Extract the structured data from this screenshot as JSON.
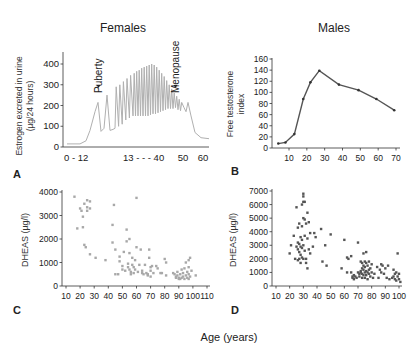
{
  "figure": {
    "xlabel": "Age (years)",
    "titles": {
      "females": "Females",
      "males": "Males"
    }
  },
  "chart_data": [
    {
      "panel": "A",
      "type": "line",
      "title": "Females",
      "ylabel": "Estrogen excreted in urine (µg/24 hours)",
      "ylabel_lines": [
        "Estrogen excreted in urine",
        "(µg/24 hours)"
      ],
      "xlabel": "",
      "x_tick_labels": [
        "0 - 12",
        "13 - - - 40",
        "50",
        "60"
      ],
      "y_ticks": [
        0,
        100,
        200,
        300,
        400
      ],
      "ylim": [
        0,
        450
      ],
      "color": "#b0b0b0",
      "annotations": [
        {
          "text": "Puberty",
          "y": 215
        },
        {
          "text": "Menopause",
          "y": 215
        }
      ],
      "description": "Low baseline (~15) during childhood 0-12, rises to ~215 at puberty, cyclic oscillations with peaks rising to ~400 and troughs ~150 during reproductive years 13-40, declining peaks to ~215 at menopause (~47), then falls to ~40 by 60."
    },
    {
      "panel": "B",
      "type": "line",
      "title": "Males",
      "ylabel": "Free testosterone index",
      "ylabel_lines": [
        "Free testosterone",
        "index"
      ],
      "x": [
        4,
        8,
        13,
        18,
        22,
        27,
        38,
        49,
        59,
        69
      ],
      "values": [
        8,
        10,
        25,
        88,
        118,
        139,
        114,
        104,
        88,
        68
      ],
      "x_ticks": [
        10,
        20,
        30,
        40,
        50,
        60,
        70
      ],
      "y_ticks": [
        0,
        20,
        40,
        60,
        80,
        100,
        120,
        140,
        160
      ],
      "xlim": [
        0,
        70
      ],
      "ylim": [
        0,
        160
      ],
      "color": "#555555"
    },
    {
      "panel": "C",
      "type": "scatter",
      "title": "",
      "ylabel": "DHEAS (µg/l)",
      "x_ticks": [
        10,
        20,
        30,
        40,
        50,
        60,
        70,
        80,
        90,
        100,
        110
      ],
      "y_ticks": [
        0,
        1000,
        2000,
        3000,
        4000
      ],
      "xlim": [
        10,
        110
      ],
      "ylim": [
        0,
        4000
      ],
      "color": "#a8a8a8",
      "points": [
        [
          16,
          3800
        ],
        [
          18,
          2450
        ],
        [
          20,
          3300
        ],
        [
          21,
          3200
        ],
        [
          22,
          2950
        ],
        [
          22,
          2500
        ],
        [
          23,
          3500
        ],
        [
          23,
          1750
        ],
        [
          24,
          1650
        ],
        [
          25,
          3650
        ],
        [
          25,
          3350
        ],
        [
          25,
          3200
        ],
        [
          27,
          3600
        ],
        [
          27,
          3300
        ],
        [
          27,
          1350
        ],
        [
          31,
          1200
        ],
        [
          38,
          1100
        ],
        [
          43,
          2600
        ],
        [
          43,
          1850
        ],
        [
          44,
          3450
        ],
        [
          45,
          1550
        ],
        [
          45,
          500
        ],
        [
          47,
          500
        ],
        [
          48,
          1250
        ],
        [
          48,
          1050
        ],
        [
          50,
          850
        ],
        [
          50,
          700
        ],
        [
          51,
          1450
        ],
        [
          52,
          650
        ],
        [
          53,
          2400
        ],
        [
          53,
          1900
        ],
        [
          54,
          950
        ],
        [
          54,
          800
        ],
        [
          55,
          2000
        ],
        [
          55,
          1400
        ],
        [
          55,
          700
        ],
        [
          56,
          600
        ],
        [
          56,
          500
        ],
        [
          57,
          1200
        ],
        [
          57,
          900
        ],
        [
          58,
          800
        ],
        [
          58,
          550
        ],
        [
          59,
          1100
        ],
        [
          59,
          700
        ],
        [
          60,
          3750
        ],
        [
          60,
          1650
        ],
        [
          61,
          600
        ],
        [
          62,
          900
        ],
        [
          63,
          1550
        ],
        [
          64,
          650
        ],
        [
          64,
          550
        ],
        [
          65,
          500
        ],
        [
          66,
          900
        ],
        [
          67,
          550
        ],
        [
          68,
          500
        ],
        [
          68,
          450
        ],
        [
          69,
          1550
        ],
        [
          69,
          1200
        ],
        [
          70,
          800
        ],
        [
          70,
          650
        ],
        [
          70,
          400
        ],
        [
          71,
          850
        ],
        [
          72,
          550
        ],
        [
          74,
          850
        ],
        [
          75,
          750
        ],
        [
          77,
          550
        ],
        [
          78,
          550
        ],
        [
          80,
          1150
        ],
        [
          81,
          1000
        ],
        [
          81,
          450
        ],
        [
          86,
          550
        ],
        [
          87,
          500
        ],
        [
          88,
          400
        ],
        [
          88,
          350
        ],
        [
          89,
          600
        ],
        [
          89,
          450
        ],
        [
          90,
          350
        ],
        [
          90,
          300
        ],
        [
          91,
          500
        ],
        [
          91,
          300
        ],
        [
          92,
          350
        ],
        [
          92,
          700
        ],
        [
          93,
          550
        ],
        [
          93,
          400
        ],
        [
          94,
          750
        ],
        [
          94,
          300
        ],
        [
          95,
          1000
        ],
        [
          95,
          450
        ],
        [
          96,
          600
        ],
        [
          96,
          350
        ],
        [
          97,
          1100
        ],
        [
          97,
          800
        ],
        [
          97,
          500
        ],
        [
          97,
          300
        ],
        [
          98,
          1200
        ],
        [
          98,
          400
        ],
        [
          99,
          650
        ],
        [
          102,
          450
        ]
      ]
    },
    {
      "panel": "D",
      "type": "scatter",
      "title": "",
      "ylabel": "DHEAS (µg/l)",
      "x_ticks": [
        10,
        20,
        30,
        40,
        50,
        60,
        70,
        80,
        90,
        100
      ],
      "y_ticks": [
        0,
        1000,
        2000,
        3000,
        4000,
        5000,
        6000,
        7000
      ],
      "xlim": [
        10,
        100
      ],
      "ylim": [
        0,
        7000
      ],
      "color": "#555555",
      "points": [
        [
          20,
          2400
        ],
        [
          21,
          3000
        ],
        [
          23,
          3700
        ],
        [
          24,
          2000
        ],
        [
          25,
          5800
        ],
        [
          25,
          2900
        ],
        [
          26,
          4300
        ],
        [
          26,
          3200
        ],
        [
          26,
          2700
        ],
        [
          26,
          1900
        ],
        [
          27,
          4600
        ],
        [
          27,
          3100
        ],
        [
          27,
          2500
        ],
        [
          27,
          2000
        ],
        [
          28,
          3600
        ],
        [
          28,
          2900
        ],
        [
          28,
          2300
        ],
        [
          28,
          1700
        ],
        [
          29,
          6000
        ],
        [
          29,
          4400
        ],
        [
          29,
          3400
        ],
        [
          29,
          2800
        ],
        [
          29,
          2100
        ],
        [
          30,
          6800
        ],
        [
          30,
          6600
        ],
        [
          30,
          6200
        ],
        [
          30,
          5000
        ],
        [
          30,
          3000
        ],
        [
          30,
          2000
        ],
        [
          31,
          6200
        ],
        [
          31,
          4900
        ],
        [
          31,
          3700
        ],
        [
          31,
          2600
        ],
        [
          32,
          4600
        ],
        [
          32,
          2000
        ],
        [
          32,
          1700
        ],
        [
          33,
          5400
        ],
        [
          33,
          3500
        ],
        [
          33,
          1300
        ],
        [
          34,
          4700
        ],
        [
          34,
          2700
        ],
        [
          35,
          3900
        ],
        [
          35,
          2400
        ],
        [
          37,
          2900
        ],
        [
          38,
          3900
        ],
        [
          39,
          3600
        ],
        [
          43,
          4200
        ],
        [
          44,
          1800
        ],
        [
          46,
          3000
        ],
        [
          47,
          1500
        ],
        [
          50,
          3800
        ],
        [
          58,
          1300
        ],
        [
          60,
          3400
        ],
        [
          62,
          2100
        ],
        [
          62,
          1000
        ],
        [
          63,
          2000
        ],
        [
          65,
          2200
        ],
        [
          65,
          1000
        ],
        [
          66,
          700
        ],
        [
          66,
          600
        ],
        [
          67,
          800
        ],
        [
          67,
          500
        ],
        [
          68,
          700
        ],
        [
          69,
          600
        ],
        [
          70,
          3200
        ],
        [
          70,
          1000
        ],
        [
          71,
          900
        ],
        [
          71,
          700
        ],
        [
          72,
          1800
        ],
        [
          72,
          1100
        ],
        [
          72,
          1000
        ],
        [
          73,
          1700
        ],
        [
          73,
          1300
        ],
        [
          73,
          900
        ],
        [
          73,
          600
        ],
        [
          74,
          2400
        ],
        [
          74,
          1500
        ],
        [
          74,
          1200
        ],
        [
          74,
          800
        ],
        [
          75,
          1800
        ],
        [
          75,
          1400
        ],
        [
          75,
          1000
        ],
        [
          75,
          600
        ],
        [
          76,
          2500
        ],
        [
          76,
          1700
        ],
        [
          76,
          1100
        ],
        [
          76,
          800
        ],
        [
          77,
          1500
        ],
        [
          77,
          1000
        ],
        [
          77,
          500
        ],
        [
          78,
          1800
        ],
        [
          78,
          1200
        ],
        [
          78,
          900
        ],
        [
          79,
          1300
        ],
        [
          79,
          700
        ],
        [
          80,
          1600
        ],
        [
          80,
          1000
        ],
        [
          81,
          600
        ],
        [
          82,
          900
        ],
        [
          84,
          1400
        ],
        [
          85,
          600
        ],
        [
          86,
          1200
        ],
        [
          87,
          1600
        ],
        [
          87,
          1000
        ],
        [
          88,
          1500
        ],
        [
          89,
          900
        ],
        [
          90,
          1300
        ],
        [
          91,
          600
        ],
        [
          92,
          1500
        ],
        [
          93,
          500
        ],
        [
          95,
          600
        ],
        [
          96,
          1200
        ],
        [
          96,
          700
        ],
        [
          97,
          900
        ],
        [
          97,
          500
        ],
        [
          98,
          1000
        ],
        [
          98,
          400
        ],
        [
          99,
          2400
        ],
        [
          99,
          700
        ],
        [
          100,
          900
        ],
        [
          100,
          500
        ],
        [
          101,
          300
        ]
      ]
    }
  ]
}
